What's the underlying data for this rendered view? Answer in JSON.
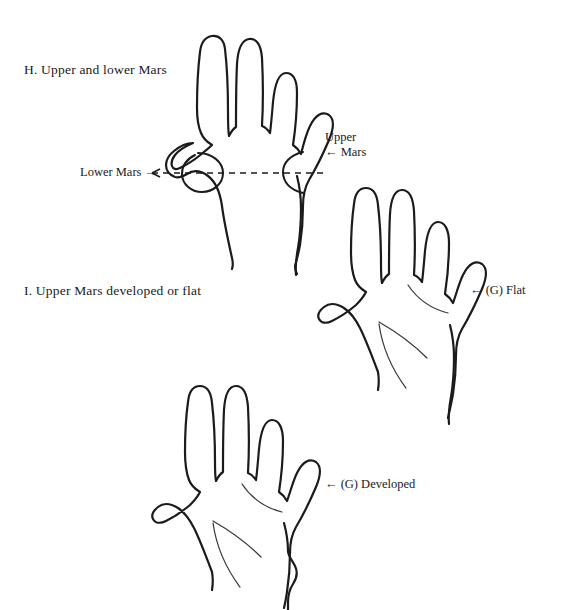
{
  "figure": {
    "title_section_h": "H.  Upper and lower Mars",
    "title_section_i": "I.  Upper Mars developed or flat",
    "background_color": "#ffffff",
    "ink_color": "#1b1b1b",
    "palm_line_color": "#3a3a3a"
  },
  "labels": {
    "lower_mars": "Lower Mars →",
    "upper_mars_line1": "Upper",
    "upper_mars_line2": "← Mars",
    "flat": "← (G) Flat",
    "developed": "← (G) Developed"
  },
  "diagram": {
    "hand_top": {
      "name": "hand-upper-and-lower-mars",
      "annotations": [
        "lower-mars-mound",
        "upper-mars-mound",
        "horizontal-dashed-guide"
      ]
    },
    "hand_right": {
      "name": "hand-upper-mars-flat",
      "marker": "(G) Flat",
      "palm_lines": [
        "heart-line",
        "head-line",
        "life-line"
      ]
    },
    "hand_bottom": {
      "name": "hand-upper-mars-developed",
      "marker": "(G) Developed",
      "palm_lines": [
        "heart-line",
        "head-line",
        "life-line"
      ]
    }
  },
  "icons": {
    "arrow_right": "→",
    "arrow_left": "←"
  }
}
